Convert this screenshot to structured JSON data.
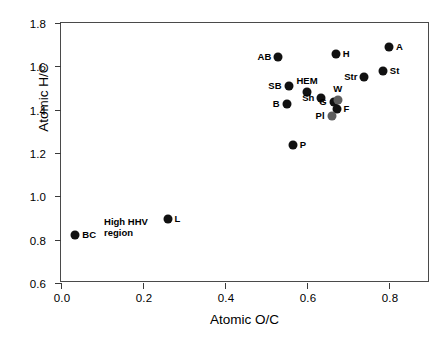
{
  "chart_data": {
    "type": "scatter",
    "title": "",
    "xlabel": "Atomic O/C",
    "ylabel": "Atomic H/C",
    "xlim": [
      0.0,
      0.9
    ],
    "ylim": [
      0.6,
      1.8
    ],
    "xticks": [
      "0.0",
      "0.2",
      "0.4",
      "0.6",
      "0.8"
    ],
    "xtick_values": [
      0.0,
      0.2,
      0.4,
      0.6,
      0.8
    ],
    "yticks": [
      "0.6",
      "0.8",
      "1.0",
      "1.2",
      "1.4",
      "1.6",
      "1.8"
    ],
    "ytick_values": [
      0.6,
      0.8,
      1.0,
      1.2,
      1.4,
      1.6,
      1.8
    ],
    "grid": false,
    "legend": "none",
    "marker_color": "#111111",
    "marker_color_secondary": "#5e5e5e",
    "points": [
      {
        "label": "BC",
        "x": 0.035,
        "y": 0.82,
        "label_pos": "right",
        "shade": "dark"
      },
      {
        "label": "L",
        "x": 0.26,
        "y": 0.895,
        "label_pos": "right",
        "shade": "dark"
      },
      {
        "label": "P",
        "x": 0.565,
        "y": 1.235,
        "label_pos": "right",
        "shade": "dark"
      },
      {
        "label": "B",
        "x": 0.55,
        "y": 1.425,
        "label_pos": "left",
        "shade": "dark"
      },
      {
        "label": "SB",
        "x": 0.555,
        "y": 1.51,
        "label_pos": "left",
        "shade": "dark"
      },
      {
        "label": "AB",
        "x": 0.53,
        "y": 1.645,
        "label_pos": "left",
        "shade": "dark"
      },
      {
        "label": "HEM",
        "x": 0.6,
        "y": 1.48,
        "label_pos": "above",
        "shade": "dark"
      },
      {
        "label": "Sh",
        "x": 0.635,
        "y": 1.455,
        "label_pos": "left",
        "shade": "dark"
      },
      {
        "label": "G",
        "x": 0.665,
        "y": 1.435,
        "label_pos": "left",
        "shade": "dark"
      },
      {
        "label": "W",
        "x": 0.675,
        "y": 1.445,
        "label_pos": "above",
        "shade": "grey"
      },
      {
        "label": "F",
        "x": 0.672,
        "y": 1.402,
        "label_pos": "right",
        "shade": "dark"
      },
      {
        "label": "Pl",
        "x": 0.66,
        "y": 1.37,
        "label_pos": "left",
        "shade": "grey"
      },
      {
        "label": "H",
        "x": 0.67,
        "y": 1.655,
        "label_pos": "right",
        "shade": "dark"
      },
      {
        "label": "Str",
        "x": 0.74,
        "y": 1.55,
        "label_pos": "left",
        "shade": "dark"
      },
      {
        "label": "St",
        "x": 0.785,
        "y": 1.58,
        "label_pos": "right",
        "shade": "dark"
      },
      {
        "label": "A",
        "x": 0.8,
        "y": 1.69,
        "label_pos": "right",
        "shade": "dark"
      }
    ],
    "annotations": [
      {
        "text": "High HHV\nregion",
        "x": 0.105,
        "y": 0.905
      }
    ]
  }
}
